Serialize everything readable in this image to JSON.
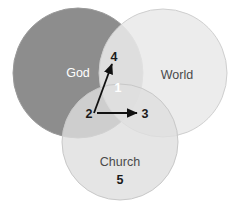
{
  "diagram": {
    "type": "venn-3-circle",
    "title": "",
    "background_color": "#ffffff",
    "circles": [
      {
        "id": "god",
        "label": "God",
        "fill": "#8d8d8d",
        "stroke": "#9a9a9a",
        "label_color": "#ffffff",
        "cx": 78,
        "cy": 73,
        "r": 65,
        "label_x": 78,
        "label_y": 74
      },
      {
        "id": "world",
        "label": "World",
        "fill": "#e9e9e9",
        "stroke": "#cfcfcf",
        "label_color": "#4a4a4a",
        "cx": 163,
        "cy": 73,
        "r": 64,
        "label_x": 177,
        "label_y": 76
      },
      {
        "id": "church",
        "label": "Church",
        "fill": "#dedede",
        "stroke": "#c8c8c8",
        "label_color": "#4a4a4a",
        "cx": 120,
        "cy": 142,
        "r": 58,
        "label_x": 120,
        "label_y": 163
      }
    ],
    "regions": [
      {
        "id": "region-4",
        "number": "4",
        "x": 114,
        "y": 58,
        "color": "#1a1a1a"
      },
      {
        "id": "region-1",
        "number": "1",
        "x": 118,
        "y": 89,
        "color": "#ffffff"
      },
      {
        "id": "region-2",
        "number": "2",
        "x": 89,
        "y": 115,
        "color": "#1a1a1a"
      },
      {
        "id": "region-3",
        "number": "3",
        "x": 145,
        "y": 115,
        "color": "#1a1a1a"
      },
      {
        "id": "region-5",
        "number": "5",
        "x": 120,
        "y": 181,
        "color": "#1a1a1a"
      }
    ],
    "arrows": [
      {
        "id": "arrow-2-to-4",
        "from_label": "2",
        "to_label": "4",
        "x1": 94,
        "y1": 113,
        "x2": 112,
        "y2": 64,
        "color": "#111111"
      },
      {
        "id": "arrow-2-to-3",
        "from_label": "2",
        "to_label": "3",
        "x1": 97,
        "y1": 113,
        "x2": 137,
        "y2": 113,
        "color": "#111111"
      }
    ]
  }
}
